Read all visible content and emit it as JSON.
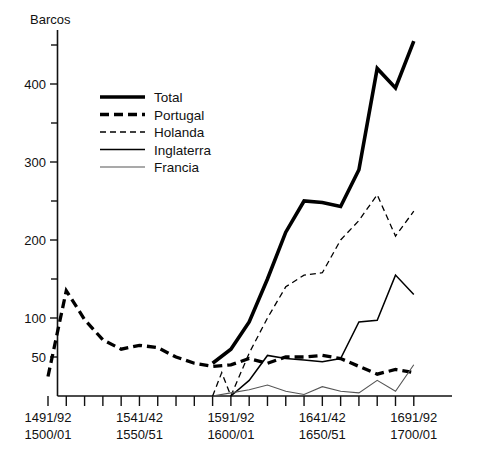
{
  "chart_data": {
    "type": "line",
    "title": "Barcos",
    "ylabel": "Barcos",
    "xlabel": "",
    "ylim": [
      0,
      470
    ],
    "grid": false,
    "legend_position": "upper-left-inside",
    "y_major_ticks": [
      50,
      100,
      200,
      300,
      400
    ],
    "y_minor_ticks": [
      150,
      250,
      350,
      450
    ],
    "x_tick_labels": [
      {
        "line1": "1491/92",
        "line2": "1500/01",
        "x": 1495
      },
      {
        "line1": "1541/42",
        "line2": "1550/51",
        "x": 1545
      },
      {
        "line1": "1591/92",
        "line2": "1600/01",
        "x": 1595
      },
      {
        "line1": "1641/42",
        "line2": "1650/51",
        "x": 1645
      },
      {
        "line1": "1691/92",
        "line2": "1700/01",
        "x": 1695
      }
    ],
    "x": [
      1495,
      1505,
      1515,
      1525,
      1535,
      1545,
      1555,
      1565,
      1575,
      1585,
      1595,
      1605,
      1615,
      1625,
      1635,
      1645,
      1655,
      1665,
      1675,
      1685,
      1695
    ],
    "xlim": [
      1490,
      1700
    ],
    "series": [
      {
        "name": "Total",
        "style": "thick-solid",
        "color": "#000000",
        "width": 3.6,
        "dash": "none",
        "values": [
          null,
          null,
          null,
          null,
          null,
          null,
          null,
          null,
          null,
          42,
          60,
          95,
          150,
          210,
          250,
          248,
          243,
          290,
          420,
          395,
          455
        ]
      },
      {
        "name": "Portugal",
        "style": "thick-dashed",
        "color": "#000000",
        "width": 3.3,
        "dash": "9,5",
        "values": [
          25,
          135,
          98,
          72,
          60,
          65,
          62,
          50,
          42,
          38,
          40,
          48,
          42,
          50,
          50,
          52,
          48,
          38,
          28,
          34,
          30
        ]
      },
      {
        "name": "Holanda",
        "style": "thin-dashed",
        "color": "#000000",
        "width": 1.3,
        "dash": "6,4",
        "values": [
          null,
          null,
          null,
          null,
          null,
          null,
          null,
          null,
          null,
          null,
          0,
          55,
          100,
          140,
          155,
          158,
          200,
          225,
          258,
          205,
          237
        ]
      },
      {
        "name": "Inglaterra",
        "style": "medium-solid",
        "color": "#000000",
        "width": 1.5,
        "dash": "none",
        "values": [
          null,
          null,
          null,
          null,
          null,
          null,
          null,
          null,
          null,
          null,
          0,
          20,
          52,
          48,
          46,
          44,
          48,
          95,
          97,
          155,
          130
        ]
      },
      {
        "name": "Francia",
        "style": "thin-solid",
        "color": "#555555",
        "width": 1.1,
        "dash": "none",
        "values": [
          null,
          null,
          null,
          null,
          null,
          null,
          null,
          null,
          null,
          0,
          4,
          8,
          14,
          6,
          2,
          12,
          6,
          4,
          20,
          6,
          40
        ]
      }
    ],
    "annotations": {
      "holanda_spike": {
        "x": 1590,
        "value": 30,
        "note": "brief spike before 1591/92"
      }
    }
  },
  "legend": {
    "entries": [
      {
        "label": "Total",
        "key": "total"
      },
      {
        "label": "Portugal",
        "key": "portugal"
      },
      {
        "label": "Holanda",
        "key": "holanda"
      },
      {
        "label": "Inglaterra",
        "key": "inglaterra"
      },
      {
        "label": "Francia",
        "key": "francia"
      }
    ]
  }
}
